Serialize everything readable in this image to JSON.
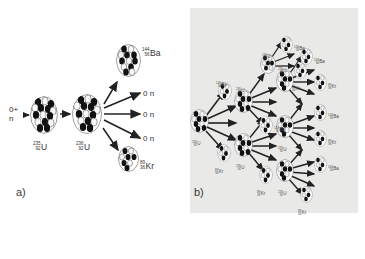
{
  "figure": {
    "background": "#ffffff",
    "panel_b_background": "#e9e9e7"
  },
  "panels": [
    {
      "id": "a",
      "label": "a)",
      "caption": "Single fission event of Uranium-235"
    },
    {
      "id": "b",
      "label": "b)",
      "caption": "Branching nuclear chain reaction"
    }
  ],
  "panel_a": {
    "incoming": {
      "symbol": "n",
      "mass": "0",
      "plus": "+",
      "text_line1": "0+",
      "text_line2": "n"
    },
    "nuclei": [
      {
        "name": "uranium-235",
        "mass": "235",
        "atomic": "92",
        "symbol": "U",
        "role": "target"
      },
      {
        "name": "uranium-236",
        "mass": "236",
        "atomic": "92",
        "symbol": "U",
        "role": "compound"
      },
      {
        "name": "barium-144",
        "mass": "144",
        "atomic": "56",
        "symbol": "Ba",
        "role": "fragment"
      },
      {
        "name": "krypton-89",
        "mass": "89",
        "atomic": "36",
        "symbol": "Kr",
        "role": "fragment"
      }
    ],
    "emitted_neutrons": [
      {
        "mass": "0",
        "symbol": "n"
      },
      {
        "mass": "0",
        "symbol": "n"
      },
      {
        "mass": "0",
        "symbol": "n"
      }
    ],
    "neutron_count": 3
  },
  "panel_b": {
    "generations": 4,
    "nuclei": [
      {
        "mass": "235",
        "atomic": "92",
        "symbol": "U"
      },
      {
        "mass": "235",
        "atomic": "92",
        "symbol": "U"
      },
      {
        "mass": "235",
        "atomic": "92",
        "symbol": "U"
      },
      {
        "mass": "235",
        "atomic": "92",
        "symbol": "U"
      },
      {
        "mass": "235",
        "atomic": "92",
        "symbol": "U"
      },
      {
        "mass": "235",
        "atomic": "92",
        "symbol": "U"
      },
      {
        "mass": "235",
        "atomic": "92",
        "symbol": "U"
      }
    ],
    "fragments": [
      {
        "mass": "144",
        "atomic": "56",
        "symbol": "Ba"
      },
      {
        "mass": "89",
        "atomic": "36",
        "symbol": "Kr"
      },
      {
        "mass": "144",
        "atomic": "56",
        "symbol": "Ba"
      },
      {
        "mass": "89",
        "atomic": "36",
        "symbol": "Kr"
      },
      {
        "mass": "144",
        "atomic": "56",
        "symbol": "Ba"
      },
      {
        "mass": "89",
        "atomic": "36",
        "symbol": "Kr"
      },
      {
        "mass": "144",
        "atomic": "56",
        "symbol": "Ba"
      },
      {
        "mass": "89",
        "atomic": "36",
        "symbol": "Kr"
      },
      {
        "mass": "144",
        "atomic": "56",
        "symbol": "Ba"
      },
      {
        "mass": "89",
        "atomic": "36",
        "symbol": "Kr"
      },
      {
        "mass": "144",
        "atomic": "56",
        "symbol": "Ba"
      },
      {
        "mass": "89",
        "atomic": "36",
        "symbol": "Kr"
      }
    ]
  },
  "colors": {
    "proton": "#1a1a1a",
    "neutron": "#f2f2f2",
    "nucleus_outline": "#555555",
    "arrow": "#222222",
    "text": "#2f2f2f"
  }
}
